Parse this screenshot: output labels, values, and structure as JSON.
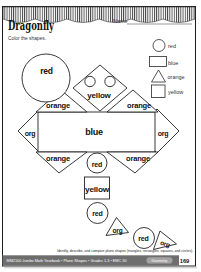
{
  "header": {
    "title": "Dragonfly",
    "name_label": "Name",
    "instruction": "Color the shapes."
  },
  "legend": {
    "items": [
      {
        "shape": "circle",
        "color_word": "red"
      },
      {
        "shape": "rectangle",
        "color_word": "blue"
      },
      {
        "shape": "triangle",
        "color_word": "orange"
      },
      {
        "shape": "square",
        "color_word": "yellow"
      }
    ]
  },
  "figure": {
    "shape_labels": {
      "big_circle": "red",
      "head_diamond": "yellow",
      "body_rectangle": "blue",
      "wing_top_left": "orange",
      "wing_top_right": "orange",
      "wing_bottom_left": "orange",
      "wing_bottom_right": "orange",
      "side_diamond_left": "org",
      "side_diamond_right": "org",
      "tail_circle_1": "red",
      "tail_square": "yellow",
      "tail_circle_2": "red",
      "tail_triangle_1": "org",
      "tail_circle_3": "red",
      "tail_triangle_2": "org"
    }
  },
  "footer": {
    "skill_text": "Identify, describe, and compare plane shapes (triangles, rectangles, squares, and circles).",
    "credit_text": "MM2100 Jumbo Math Yearbook • Plane Shapes • Grades 1-3 • EMC 30",
    "badge_label": "Geometry",
    "page_number": "169"
  },
  "colors": {
    "ink": "#222222",
    "bar_gray": "#6e6e6e",
    "badge_gray": "#a3a3a3"
  }
}
